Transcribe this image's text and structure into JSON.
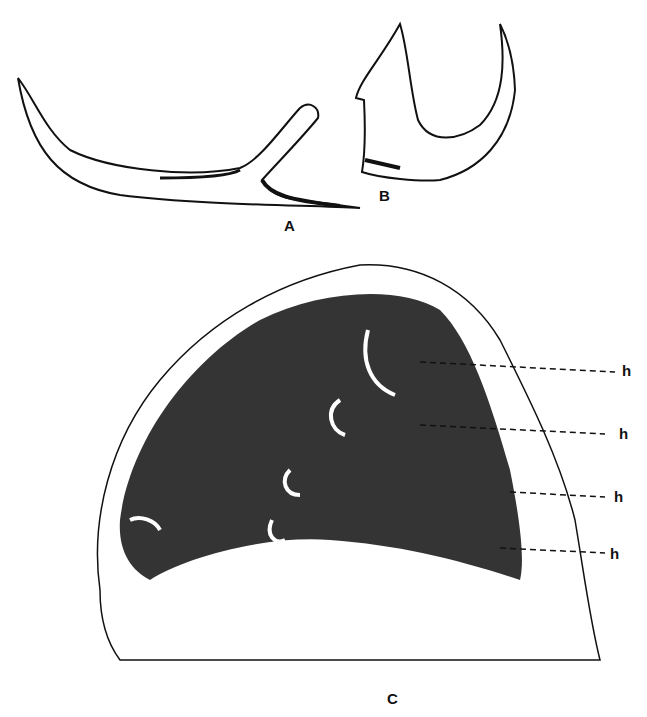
{
  "figure": {
    "panels": [
      {
        "id": "A",
        "label": "A",
        "description": "curved hook-shaped sclerite with forked base"
      },
      {
        "id": "B",
        "label": "B",
        "description": "U-shaped hook sclerite"
      },
      {
        "id": "C",
        "label": "C",
        "description": "tissue section with embedded hooks"
      }
    ],
    "callouts": [
      {
        "label": "h"
      },
      {
        "label": "h"
      },
      {
        "label": "h"
      },
      {
        "label": "h"
      }
    ],
    "colors": {
      "ink": "#111111",
      "background": "#ffffff"
    }
  }
}
